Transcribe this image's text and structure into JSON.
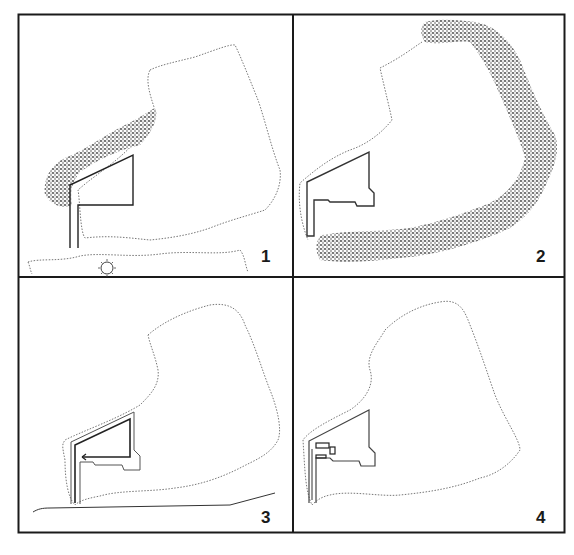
{
  "figure": {
    "layout": "2x2 grid of site plan panels",
    "panels": [
      {
        "number": "1",
        "content": "site outline with building and vegetation band along northwest edge; road and sun at bottom"
      },
      {
        "number": "2",
        "content": "site outline with building and vegetation band around east and south perimeter"
      },
      {
        "number": "3",
        "content": "site outline with building outline, inner path with arrow, and road line"
      },
      {
        "number": "4",
        "content": "site outline with building and small interior rectangles"
      }
    ]
  },
  "colors": {
    "frame": "#1a1a1a",
    "line": "#333333",
    "dotted_outline": "#777777",
    "hatch": "#4a4a4a",
    "background": "#ffffff"
  }
}
